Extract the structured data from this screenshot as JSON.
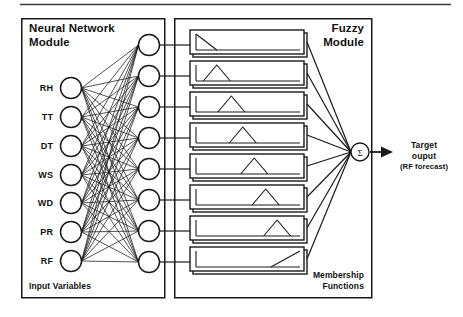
{
  "figure": {
    "kind": "neuro-fuzzy-architecture-diagram",
    "top_rule": true,
    "bottom_rule": false
  },
  "neural_module": {
    "title_line1": "Neural Network",
    "title_line2": "Module",
    "footer_label": "Input Variables",
    "input_nodes": [
      {
        "label": "RH",
        "cx": 71,
        "cy": 88
      },
      {
        "label": "TT",
        "cx": 71,
        "cy": 117
      },
      {
        "label": "DT",
        "cx": 71,
        "cy": 146
      },
      {
        "label": "WS",
        "cx": 71,
        "cy": 175
      },
      {
        "label": "WD",
        "cx": 71,
        "cy": 203
      },
      {
        "label": "PR",
        "cx": 71,
        "cy": 232
      },
      {
        "label": "RF",
        "cx": 71,
        "cy": 261
      }
    ],
    "hidden_nodes": [
      {
        "cy": 45
      },
      {
        "cy": 76
      },
      {
        "cy": 107
      },
      {
        "cy": 138
      },
      {
        "cy": 169
      },
      {
        "cy": 200
      },
      {
        "cy": 231
      },
      {
        "cy": 262
      }
    ],
    "hidden_cx": 149,
    "node_radius": 10.5,
    "box": {
      "x": 21,
      "y": 18,
      "w": 143,
      "h": 279
    }
  },
  "fuzzy_module": {
    "title_line1": "Fuzzy",
    "title_line2": "Module",
    "footer_line1": "Membership",
    "footer_line2": "Functions",
    "box": {
      "x": 174,
      "y": 18,
      "w": 197,
      "h": 279
    },
    "membership_functions": [
      {
        "index": 1,
        "shape": "falling-ramp-left",
        "cy": 42
      },
      {
        "index": 2,
        "shape": "triangle",
        "cy": 73,
        "peak": 0.2
      },
      {
        "index": 3,
        "shape": "triangle",
        "cy": 104,
        "peak": 0.34
      },
      {
        "index": 4,
        "shape": "triangle",
        "cy": 135,
        "peak": 0.45
      },
      {
        "index": 5,
        "shape": "triangle",
        "cy": 166,
        "peak": 0.56
      },
      {
        "index": 6,
        "shape": "triangle",
        "cy": 197,
        "peak": 0.67
      },
      {
        "index": 7,
        "shape": "triangle",
        "cy": 228,
        "peak": 0.78
      },
      {
        "index": 8,
        "shape": "rising-ramp-right",
        "cy": 259
      }
    ],
    "mf_box": {
      "x": 190,
      "y_top": 30,
      "w": 114,
      "h": 24,
      "pitch": 31
    }
  },
  "output": {
    "sum_symbol": "Σ",
    "sum_node": {
      "cx": 360,
      "cy": 152,
      "r": 9
    },
    "label_line1": "Target",
    "label_line2": "ouput",
    "label_line3": "(RF forecast)"
  },
  "colors": {
    "stroke": "#1a1a1a",
    "fill": "#ffffff",
    "text": "#111111",
    "background": "#ffffff",
    "rule": "#3a3a3a"
  }
}
